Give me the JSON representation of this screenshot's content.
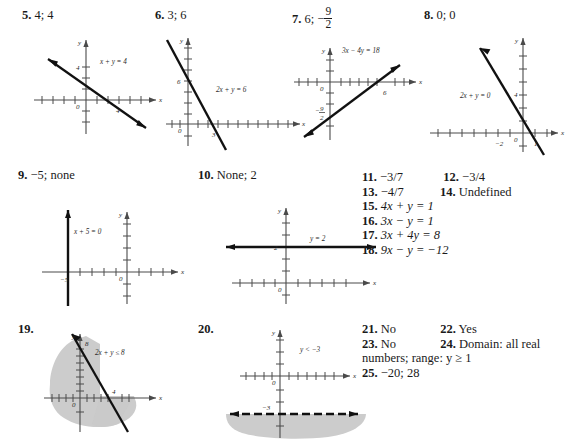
{
  "page": {
    "type": "textbook-answer-key",
    "width": 577,
    "height": 445
  },
  "exercises": [
    {
      "number": "5.",
      "answer": "4; 4",
      "graph": {
        "equation_label": "x + y = 4",
        "x_intercept_label": "4",
        "y_intercept_label": "4",
        "axis_x_label": "x",
        "axis_y_label": "y",
        "origin_label": "0"
      }
    },
    {
      "number": "6.",
      "answer": "3; 6",
      "graph": {
        "equation_label": "2x + y = 6",
        "x_intercept_label": "3",
        "y_intercept_label": "6",
        "axis_x_label": "x",
        "axis_y_label": "y",
        "origin_label": "0"
      }
    },
    {
      "number": "7.",
      "answer_prefix": "6;",
      "answer_fraction_sign": "−",
      "answer_fraction_num": "9",
      "answer_fraction_den": "2",
      "graph": {
        "equation_label": "3x − 4y = 18",
        "x_intercept_label": "6",
        "y_intercept_num": "9",
        "y_intercept_den": "2",
        "y_intercept_sign": "−",
        "axis_x_label": "x",
        "axis_y_label": "y",
        "origin_label": "0"
      }
    },
    {
      "number": "8.",
      "answer": "0; 0",
      "graph": {
        "equation_label": "2x + y = 0",
        "tick_label_neg2": "−2",
        "tick_label_1": "1",
        "tick_label_4": "4",
        "axis_x_label": "x",
        "axis_y_label": "y",
        "origin_label": "0"
      }
    },
    {
      "number": "9.",
      "answer": "−5; none",
      "graph": {
        "equation_label": "x + 5 = 0",
        "x_intercept_label": "−5",
        "axis_x_label": "x",
        "axis_y_label": "y",
        "origin_label": "0"
      }
    },
    {
      "number": "10.",
      "answer": "None; 2",
      "graph": {
        "equation_label": "y = 2",
        "y_intercept_label": "2",
        "axis_x_label": "x",
        "axis_y_label": "y",
        "origin_label": "0"
      }
    },
    {
      "number": "19.",
      "answer": "",
      "graph": {
        "equation_label": "2x + y ≤ 8",
        "x_intercept_label": "4",
        "y_intercept_label": "8",
        "axis_x_label": "x",
        "axis_y_label": "y",
        "origin_label": "0",
        "shaded": true,
        "boundary": "solid"
      }
    },
    {
      "number": "20.",
      "answer": "",
      "graph": {
        "equation_label": "y < −3",
        "y_intercept_label": "−3",
        "axis_x_label": "x",
        "axis_y_label": "y",
        "origin_label": "0",
        "shaded": true,
        "boundary": "dashed"
      }
    }
  ],
  "answer_list": {
    "rows": [
      {
        "left_num": "11.",
        "left_text": "−3/7",
        "right_num": "12.",
        "right_text": "−3/4"
      },
      {
        "left_num": "13.",
        "left_text": "−4/7",
        "right_num": "14.",
        "right_text": "Undefined"
      }
    ],
    "equations": [
      {
        "num": "15.",
        "text": "4x + y = 1"
      },
      {
        "num": "16.",
        "text": "3x − y = 1"
      },
      {
        "num": "17.",
        "text": "3x + 4y = 8"
      },
      {
        "num": "18.",
        "text": "9x − y = −12"
      }
    ],
    "rows2": [
      {
        "left_num": "21.",
        "left_text": "No",
        "right_num": "22.",
        "right_text": "Yes"
      },
      {
        "left_num": "23.",
        "left_text": "No",
        "right_num": "24.",
        "right_text": "Domain: all real"
      }
    ],
    "wrap_line": "numbers; range: y ≥ 1",
    "final": {
      "num": "25.",
      "text": "−20; 28"
    }
  },
  "colors": {
    "ink": "#1a1a1a",
    "axis": "#4a4a4a",
    "shade": "#c4c4c4"
  }
}
